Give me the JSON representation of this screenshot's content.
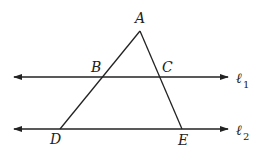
{
  "diagram": {
    "type": "geometry",
    "points": {
      "A": {
        "label": "A",
        "x": 140,
        "y": 31
      },
      "B": {
        "label": "B",
        "x": 102,
        "y": 77
      },
      "C": {
        "label": "C",
        "x": 160,
        "y": 77
      },
      "D": {
        "label": "D",
        "x": 60,
        "y": 129
      },
      "E": {
        "label": "E",
        "x": 182,
        "y": 129
      }
    },
    "lines": {
      "l1": {
        "label": "ℓ",
        "subscript": "1",
        "y": 77,
        "x1": 13,
        "x2": 229
      },
      "l2": {
        "label": "ℓ",
        "subscript": "2",
        "y": 129,
        "x1": 13,
        "x2": 229
      }
    },
    "segments": [
      "AD",
      "AE"
    ]
  }
}
